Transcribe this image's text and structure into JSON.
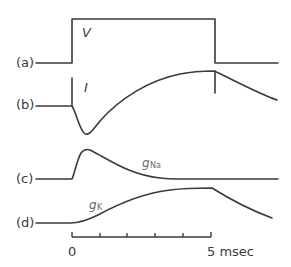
{
  "figure": {
    "panels": [
      {
        "id": "a",
        "label": "(a)",
        "symbol": "V",
        "description": "voltage step"
      },
      {
        "id": "b",
        "label": "(b)",
        "symbol": "I",
        "description": "membrane current"
      },
      {
        "id": "c",
        "label": "(c)",
        "symbol": "g",
        "subscript": "Na",
        "description": "sodium conductance"
      },
      {
        "id": "d",
        "label": "(d)",
        "symbol": "g",
        "subscript": "K",
        "description": "potassium conductance"
      }
    ],
    "time_axis": {
      "start_label": "0",
      "end_label": "5 msec",
      "tick_count": 6
    },
    "colors": {
      "stroke": "#3a3a3a",
      "secondary_text": "#6a6a6a",
      "background": "#ffffff"
    }
  }
}
